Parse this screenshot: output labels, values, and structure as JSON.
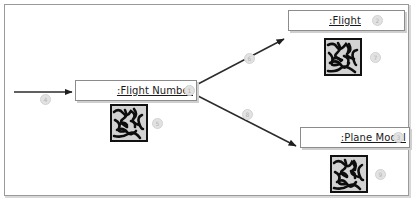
{
  "diagram": {
    "frame": {
      "border_color": "#9a9a9a",
      "background": "#ffffff"
    },
    "nodes": [
      {
        "id": "flight-number",
        "label": ":Flight Number",
        "badge": "1",
        "x": 75,
        "y": 80,
        "width": 122,
        "height": 21
      },
      {
        "id": "flight",
        "label": ":Flight",
        "badge": "2",
        "x": 288,
        "y": 10,
        "width": 117,
        "height": 21
      },
      {
        "id": "plane-model",
        "label": ":Plane Model",
        "badge": "3",
        "x": 300,
        "y": 127,
        "width": 110,
        "height": 21
      }
    ],
    "thumbnails": [
      {
        "id": "thumb-flight-number",
        "x": 110,
        "y": 104,
        "size": 38,
        "badge": "5"
      },
      {
        "id": "thumb-flight",
        "x": 324,
        "y": 38,
        "size": 38,
        "badge": "7"
      },
      {
        "id": "thumb-plane-model",
        "x": 330,
        "y": 155,
        "size": 38,
        "badge": "9"
      }
    ],
    "edges": [
      {
        "id": "edge-incoming",
        "kind": "arrow",
        "badge": "4",
        "from": [
          14,
          92
        ],
        "to": [
          74,
          92
        ],
        "badge_pos": [
          44,
          97
        ]
      },
      {
        "id": "edge-to-flight",
        "kind": "arrow",
        "badge": "6",
        "from": [
          198,
          84
        ],
        "to": [
          286,
          38
        ],
        "badge_pos": [
          248,
          57
        ]
      },
      {
        "id": "edge-to-plane-model",
        "kind": "arrow",
        "badge": "8",
        "from": [
          198,
          96
        ],
        "to": [
          298,
          147
        ],
        "badge_pos": [
          246,
          113
        ]
      }
    ],
    "stroke_color": "#2b2b2b",
    "badge_color": "#e2e2e2"
  }
}
